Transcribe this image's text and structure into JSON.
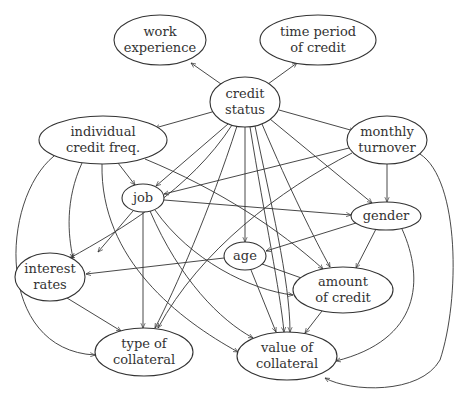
{
  "diagram": {
    "type": "directed-graph",
    "colors": {
      "stroke": "#333333",
      "background": "#ffffff",
      "text": "#333333"
    },
    "nodes": [
      {
        "id": "work_experience",
        "lines": [
          "work",
          "experience"
        ],
        "cx": 160,
        "cy": 40,
        "rx": 46,
        "ry": 25
      },
      {
        "id": "time_period",
        "lines": [
          "time period",
          "of credit"
        ],
        "cx": 318,
        "cy": 40,
        "rx": 58,
        "ry": 25
      },
      {
        "id": "credit_status",
        "lines": [
          "credit",
          "status"
        ],
        "cx": 245,
        "cy": 102,
        "rx": 35,
        "ry": 25
      },
      {
        "id": "indiv_credit_freq",
        "lines": [
          "individual",
          "credit freq."
        ],
        "cx": 103,
        "cy": 140,
        "rx": 64,
        "ry": 24
      },
      {
        "id": "monthly_turnover",
        "lines": [
          "monthly",
          "turnover"
        ],
        "cx": 387,
        "cy": 140,
        "rx": 40,
        "ry": 24
      },
      {
        "id": "job",
        "lines": [
          "job"
        ],
        "cx": 143,
        "cy": 198,
        "rx": 21,
        "ry": 14
      },
      {
        "id": "gender",
        "lines": [
          "gender"
        ],
        "cx": 386,
        "cy": 216,
        "rx": 35,
        "ry": 14
      },
      {
        "id": "age",
        "lines": [
          "age"
        ],
        "cx": 245,
        "cy": 256,
        "rx": 21,
        "ry": 14
      },
      {
        "id": "interest_rates",
        "lines": [
          "interest",
          "rates"
        ],
        "cx": 50,
        "cy": 277,
        "rx": 35,
        "ry": 24
      },
      {
        "id": "amount_of_credit",
        "lines": [
          "amount",
          "of credit"
        ],
        "cx": 343,
        "cy": 290,
        "rx": 50,
        "ry": 23
      },
      {
        "id": "type_of_collateral",
        "lines": [
          "type of",
          "collateral"
        ],
        "cx": 144,
        "cy": 352,
        "rx": 49,
        "ry": 24
      },
      {
        "id": "value_of_collateral",
        "lines": [
          "value of",
          "collateral"
        ],
        "cx": 287,
        "cy": 356,
        "rx": 50,
        "ry": 24
      }
    ],
    "edges": [
      {
        "from": "credit_status",
        "to": "work_experience",
        "d": "M221,84 L191,63"
      },
      {
        "from": "credit_status",
        "to": "time_period",
        "d": "M268,84 L297,63"
      },
      {
        "from": "credit_status",
        "to": "indiv_credit_freq",
        "d": "M212,112 L155,128"
      },
      {
        "from": "credit_status",
        "to": "monthly_turnover",
        "d": "M279,110 L354,131"
      },
      {
        "from": "credit_status",
        "to": "job",
        "d": "M228,124 L156,186"
      },
      {
        "from": "credit_status",
        "to": "interest_rates",
        "d": "M232,125 C190,190 120,230 70,258"
      },
      {
        "from": "credit_status",
        "to": "type_of_collateral",
        "d": "M237,126 C210,210 175,290 155,328"
      },
      {
        "from": "credit_status",
        "to": "age",
        "d": "M245,127 L245,242"
      },
      {
        "from": "credit_status",
        "to": "value_of_collateral",
        "d": "M250,127 C265,220 280,290 284,332"
      },
      {
        "from": "credit_status",
        "to": "value_of_collateral",
        "d": "M255,126 C270,200 290,280 290,332"
      },
      {
        "from": "credit_status",
        "to": "amount_of_credit",
        "d": "M262,124 C290,190 315,240 330,267"
      },
      {
        "from": "credit_status",
        "to": "gender",
        "d": "M270,119 L372,203"
      },
      {
        "from": "monthly_turnover",
        "to": "job",
        "d": "M349,148 L164,194"
      },
      {
        "from": "monthly_turnover",
        "to": "type_of_collateral",
        "d": "M352,153 C280,190 200,250 158,328"
      },
      {
        "from": "monthly_turnover",
        "to": "gender",
        "d": "M387,164 L387,202"
      },
      {
        "from": "monthly_turnover",
        "to": "value_of_collateral",
        "d": "M420,154 C460,180 460,300 440,360 C420,395 350,392 325,378"
      },
      {
        "from": "indiv_credit_freq",
        "to": "job",
        "d": "M118,163 L135,185"
      },
      {
        "from": "indiv_credit_freq",
        "to": "interest_rates",
        "d": "M82,163 C65,200 68,235 73,258"
      },
      {
        "from": "indiv_credit_freq",
        "to": "type_of_collateral",
        "d": "M54,156 C0,200 -5,350 95,355"
      },
      {
        "from": "indiv_credit_freq",
        "to": "value_of_collateral",
        "d": "M102,164 C100,260 180,320 238,352"
      },
      {
        "from": "indiv_credit_freq",
        "to": "amount_of_credit",
        "d": "M145,159 C220,190 280,230 323,269"
      },
      {
        "from": "job",
        "to": "interest_rates",
        "d": "M133,211 L98,252"
      },
      {
        "from": "job",
        "to": "type_of_collateral",
        "d": "M143,212 L143,328"
      },
      {
        "from": "job",
        "to": "gender",
        "d": "M164,200 L351,215"
      },
      {
        "from": "job",
        "to": "value_of_collateral",
        "d": "M150,211 C180,280 220,320 253,338"
      },
      {
        "from": "job",
        "to": "amount_of_credit",
        "d": "M155,210 C190,260 250,290 293,295"
      },
      {
        "from": "gender",
        "to": "age",
        "d": "M356,223 L266,251"
      },
      {
        "from": "gender",
        "to": "amount_of_credit",
        "d": "M376,229 L356,268"
      },
      {
        "from": "gender",
        "to": "value_of_collateral",
        "d": "M402,229 C425,280 420,340 336,361"
      },
      {
        "from": "age",
        "to": "interest_rates",
        "d": "M224,258 L86,274"
      },
      {
        "from": "age",
        "to": "amount_of_credit",
        "d": "M262,264 L307,280"
      },
      {
        "from": "age",
        "to": "value_of_collateral",
        "d": "M251,270 L276,332"
      },
      {
        "from": "interest_rates",
        "to": "type_of_collateral",
        "d": "M67,298 L121,331"
      },
      {
        "from": "amount_of_credit",
        "to": "value_of_collateral",
        "d": "M322,311 L305,333"
      }
    ]
  }
}
